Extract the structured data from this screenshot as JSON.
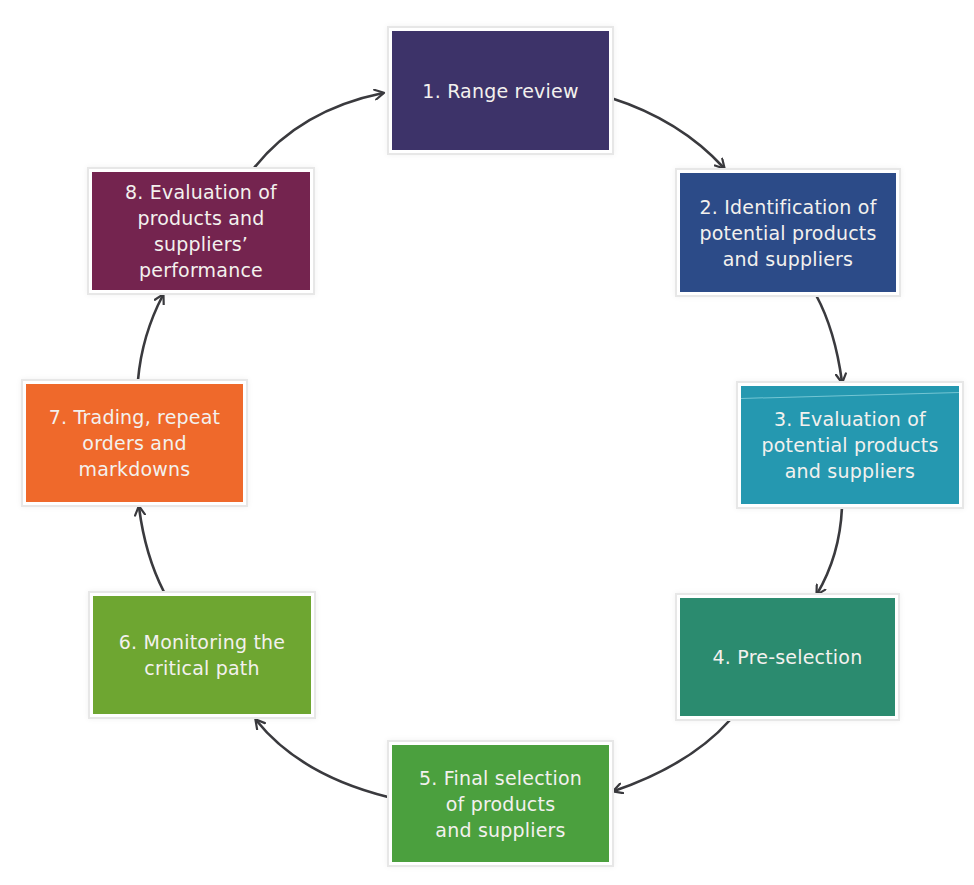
{
  "diagram": {
    "type": "cycle",
    "steps": [
      {
        "id": 1,
        "label": "1. Range review",
        "color": "#3d3369",
        "x": 392,
        "y": 31,
        "w": 217,
        "h": 119
      },
      {
        "id": 2,
        "label": "2. Identification of\npotential products\nand suppliers",
        "color": "#2c4b88",
        "x": 680,
        "y": 173,
        "w": 216,
        "h": 119
      },
      {
        "id": 3,
        "label": "3. Evaluation of\npotential products\nand suppliers",
        "color": "#2598b0",
        "x": 741,
        "y": 386,
        "w": 218,
        "h": 118
      },
      {
        "id": 4,
        "label": "4. Pre-selection",
        "color": "#2b8b6f",
        "x": 680,
        "y": 598,
        "w": 215,
        "h": 118
      },
      {
        "id": 5,
        "label": "5. Final selection\nof products\nand suppliers",
        "color": "#4ba03e",
        "x": 392,
        "y": 745,
        "w": 217,
        "h": 117
      },
      {
        "id": 6,
        "label": "6. Monitoring the\ncritical path",
        "color": "#6ea631",
        "x": 93,
        "y": 596,
        "w": 218,
        "h": 118
      },
      {
        "id": 7,
        "label": "7. Trading, repeat\norders and\nmarkdowns",
        "color": "#ef692b",
        "x": 26,
        "y": 384,
        "w": 217,
        "h": 118
      },
      {
        "id": 8,
        "label": "8. Evaluation of\nproducts and\nsuppliers’\nperformance",
        "color": "#74244f",
        "x": 92,
        "y": 172,
        "w": 218,
        "h": 118
      }
    ],
    "arrows": [
      {
        "from": 1,
        "to": 2,
        "path": "M611,98 Q680,120 724,168",
        "color": "#3a3a3e"
      },
      {
        "from": 2,
        "to": 3,
        "path": "M816,295 Q835,330 842,382",
        "color": "#3a3a3e"
      },
      {
        "from": 3,
        "to": 4,
        "path": "M842,507 Q840,555 817,594",
        "color": "#3a3a3e"
      },
      {
        "from": 4,
        "to": 5,
        "path": "M730,720 Q690,765 614,791",
        "color": "#3a3a3e"
      },
      {
        "from": 5,
        "to": 6,
        "path": "M388,797 Q300,775 256,720",
        "color": "#3a3a3e"
      },
      {
        "from": 6,
        "to": 7,
        "path": "M164,592 Q145,555 139,507",
        "color": "#3a3a3e"
      },
      {
        "from": 7,
        "to": 8,
        "path": "M138,380 Q142,335 163,295",
        "color": "#3a3a3e"
      },
      {
        "from": 8,
        "to": 1,
        "path": "M254,168 Q300,110 383,93",
        "color": "#3a3a3e"
      }
    ]
  }
}
